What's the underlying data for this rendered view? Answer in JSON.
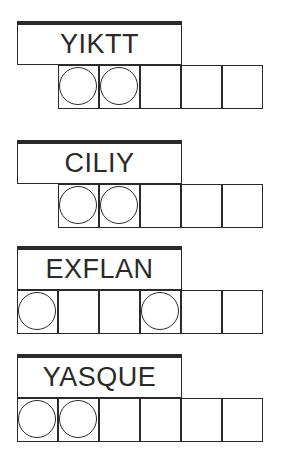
{
  "puzzles": [
    {
      "scrambled": "YIKTT",
      "top": 21,
      "cells": 5,
      "grid_start_index": 1,
      "circled": [
        0,
        1
      ]
    },
    {
      "scrambled": "CILIY",
      "top": 140,
      "cells": 5,
      "grid_start_index": 1,
      "circled": [
        0,
        1
      ]
    },
    {
      "scrambled": "EXFLAN",
      "top": 246,
      "cells": 6,
      "grid_start_index": 0,
      "circled": [
        0,
        3
      ]
    },
    {
      "scrambled": "YASQUE",
      "top": 354,
      "cells": 6,
      "grid_start_index": 0,
      "circled": [
        0,
        1
      ]
    }
  ],
  "colors": {
    "ink": "#2a2a2a",
    "background": "#ffffff"
  }
}
